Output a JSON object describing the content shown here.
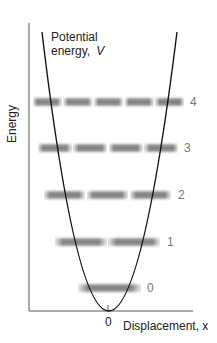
{
  "diagram": {
    "y_axis_label": "Energy",
    "x_axis_label": "Displacement, x",
    "origin_label": "0",
    "curve_label_line1": "Potential",
    "curve_label_line2": "energy,",
    "curve_label_symbol": "V",
    "colors": {
      "axis": "#555555",
      "curve": "#111111",
      "band": "#7a7a7a",
      "level_label": "#777777"
    },
    "levels": [
      {
        "n": "0",
        "y": 288,
        "x_start": 78,
        "x_end": 141,
        "segments": 1,
        "label_x": 147
      },
      {
        "n": "1",
        "y": 242,
        "x_start": 55,
        "x_end": 160,
        "segments": 2,
        "label_x": 167
      },
      {
        "n": "2",
        "y": 195,
        "x_start": 44,
        "x_end": 171,
        "segments": 3,
        "label_x": 178
      },
      {
        "n": "3",
        "y": 148,
        "x_start": 38,
        "x_end": 178,
        "segments": 4,
        "label_x": 184
      },
      {
        "n": "4",
        "y": 102,
        "x_start": 33,
        "x_end": 184,
        "segments": 5,
        "label_x": 190
      }
    ]
  }
}
